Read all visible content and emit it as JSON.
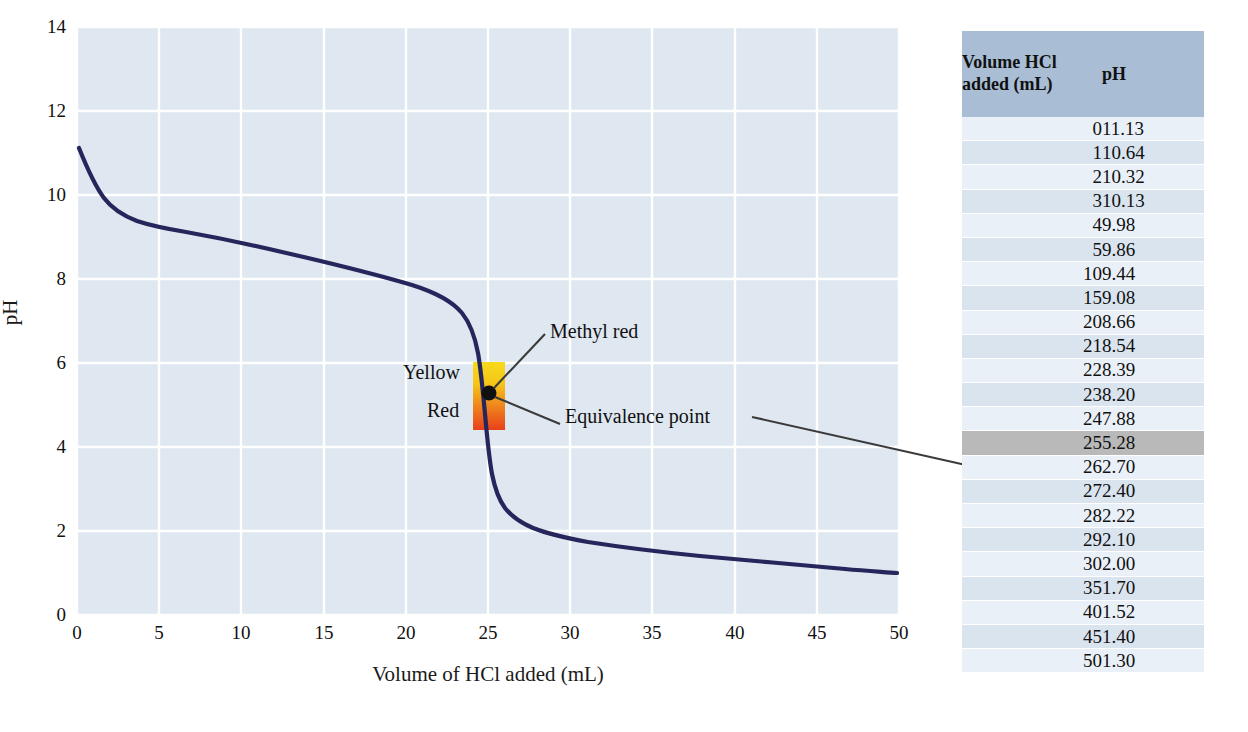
{
  "chart_data": {
    "type": "line",
    "title": "",
    "xlabel": "Volume of HCl added (mL)",
    "ylabel": "pH",
    "xlim": [
      0,
      50
    ],
    "ylim": [
      0,
      14
    ],
    "xticks": [
      0,
      5,
      10,
      15,
      20,
      25,
      30,
      35,
      40,
      45,
      50
    ],
    "yticks": [
      0,
      2,
      4,
      6,
      8,
      10,
      12,
      14
    ],
    "grid": true,
    "legend": "none",
    "series": [
      {
        "name": "Titration curve",
        "color": "#26265c",
        "x": [
          0,
          1,
          2,
          3,
          4,
          5,
          10,
          15,
          20,
          21,
          22,
          23,
          24,
          25,
          26,
          27,
          28,
          29,
          30,
          35,
          40,
          45,
          50
        ],
        "values": [
          11.13,
          10.64,
          10.32,
          10.13,
          9.98,
          9.86,
          9.44,
          9.08,
          8.66,
          8.54,
          8.39,
          8.2,
          7.88,
          5.28,
          2.7,
          2.4,
          2.22,
          2.1,
          2.0,
          1.7,
          1.52,
          1.4,
          1.3
        ]
      }
    ],
    "annotations": [
      {
        "name": "equivalence-point",
        "label": "Equivalence point",
        "x": 25,
        "y": 5.28,
        "marker": "dot"
      },
      {
        "name": "methyl-red",
        "label": "Methyl red",
        "x": 25,
        "y": 5.28
      },
      {
        "name": "indicator-upper",
        "label": "Yellow",
        "color": "#f2c21c"
      },
      {
        "name": "indicator-lower",
        "label": "Red",
        "color": "#e8441c"
      }
    ],
    "indicator_band": {
      "name": "methyl-red",
      "x_range": [
        24.1,
        26.0
      ],
      "ph_range": [
        4.4,
        6.2
      ],
      "color_top": "#f5cf1e",
      "color_bottom": "#e8401a"
    }
  },
  "axes": {
    "x_title": "Volume of HCl added (mL)",
    "y_title": "pH",
    "x_tick_labels": [
      "0",
      "5",
      "10",
      "15",
      "20",
      "25",
      "30",
      "35",
      "40",
      "45",
      "50"
    ],
    "y_tick_labels": [
      "0",
      "2",
      "4",
      "6",
      "8",
      "10",
      "12",
      "14"
    ]
  },
  "annotations": {
    "yellow": "Yellow",
    "red": "Red",
    "methyl_red": "Methyl red",
    "equivalence_point": "Equivalence point"
  },
  "table": {
    "headers": {
      "volume": "Volume HCl\nadded (mL)",
      "volume_line1": "Volume HCl",
      "volume_line2": "added (mL)",
      "ph": "pH"
    },
    "highlight_volume": "25",
    "rows": [
      {
        "volume": "0",
        "ph": "11.13"
      },
      {
        "volume": "1",
        "ph": "10.64"
      },
      {
        "volume": "2",
        "ph": "10.32"
      },
      {
        "volume": "3",
        "ph": "10.13"
      },
      {
        "volume": "4",
        "ph": "9.98"
      },
      {
        "volume": "5",
        "ph": "9.86"
      },
      {
        "volume": "10",
        "ph": "9.44"
      },
      {
        "volume": "15",
        "ph": "9.08"
      },
      {
        "volume": "20",
        "ph": "8.66"
      },
      {
        "volume": "21",
        "ph": "8.54"
      },
      {
        "volume": "22",
        "ph": "8.39"
      },
      {
        "volume": "23",
        "ph": "8.20"
      },
      {
        "volume": "24",
        "ph": "7.88"
      },
      {
        "volume": "25",
        "ph": "5.28"
      },
      {
        "volume": "26",
        "ph": "2.70"
      },
      {
        "volume": "27",
        "ph": "2.40"
      },
      {
        "volume": "28",
        "ph": "2.22"
      },
      {
        "volume": "29",
        "ph": "2.10"
      },
      {
        "volume": "30",
        "ph": "2.00"
      },
      {
        "volume": "35",
        "ph": "1.70"
      },
      {
        "volume": "40",
        "ph": "1.52"
      },
      {
        "volume": "45",
        "ph": "1.40"
      },
      {
        "volume": "50",
        "ph": "1.30"
      }
    ]
  },
  "colors": {
    "plot_background": "#dfe7f1",
    "gridline": "#ffffff",
    "curve": "#26265c",
    "table_header_bg": "#a9bed5",
    "table_row_light": "#eaf0f7",
    "table_row_dark": "#dae4ef",
    "table_highlight_bg": "#b9b9b9",
    "indicator_top": "#f5cf1e",
    "indicator_bottom": "#e8401a"
  }
}
